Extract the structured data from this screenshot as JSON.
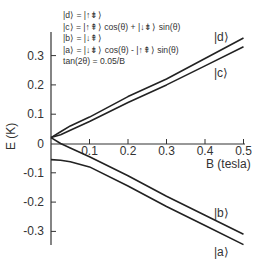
{
  "chart_data": {
    "type": "line",
    "title": "",
    "xlabel": "B (tesla)",
    "ylabel": "E (K)",
    "xlim": [
      0,
      0.5
    ],
    "ylim": [
      -0.35,
      0.38
    ],
    "xticks": [
      "0.1",
      "0.2",
      "0.3",
      "0.4",
      "0.5"
    ],
    "yticks": [
      "0.3",
      "0.2",
      "0.1",
      "0",
      "-0.1",
      "-0.2",
      "-0.3"
    ],
    "grid": false,
    "legend_position": "top-left (text annotation)",
    "annotations": [
      "|d⟩ = |↑⇟⟩",
      "|c⟩ = |↑⇞⟩ cos(θ) + |↓⇟⟩ sin(θ)",
      "|b⟩ = |↓⇞⟩",
      "|a⟩ = |↓⇟⟩ cos(θ) - |↑⇞⟩ sin(θ)",
      "tan(2θ) = 0.05/B"
    ],
    "x": [
      0,
      0.025,
      0.05,
      0.1,
      0.2,
      0.3,
      0.4,
      0.5
    ],
    "series": [
      {
        "name": "|d⟩",
        "values": [
          0.02,
          0.04,
          0.06,
          0.09,
          0.16,
          0.22,
          0.29,
          0.36
        ]
      },
      {
        "name": "|c⟩",
        "values": [
          0.02,
          0.03,
          0.045,
          0.075,
          0.14,
          0.2,
          0.265,
          0.33
        ]
      },
      {
        "name": "|b⟩",
        "values": [
          0.02,
          0.0,
          -0.015,
          -0.045,
          -0.11,
          -0.18,
          -0.245,
          -0.31
        ]
      },
      {
        "name": "|a⟩",
        "values": [
          -0.055,
          -0.057,
          -0.062,
          -0.08,
          -0.145,
          -0.215,
          -0.28,
          -0.345
        ]
      }
    ]
  },
  "labels": {
    "xlabel": "B (tesla)",
    "ylabel": "E (K)",
    "legend": [
      "|d⟩ = |↑⇟⟩",
      "|c⟩ = |↑⇞⟩ cos(θ) + |↓⇟⟩ sin(θ)",
      "|b⟩ = |↓⇞⟩",
      "|a⟩ = |↓⇟⟩ cos(θ) - |↑⇞⟩ sin(θ)",
      "tan(2θ) = 0.05/B"
    ],
    "states": {
      "d": "|d⟩",
      "c": "|c⟩",
      "b": "|b⟩",
      "a": "|a⟩"
    }
  }
}
